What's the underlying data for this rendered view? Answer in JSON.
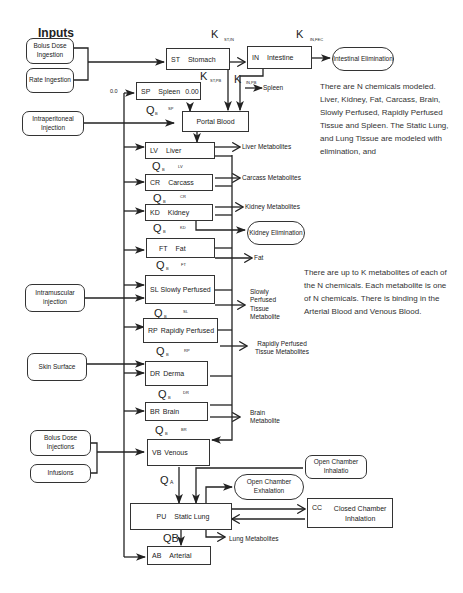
{
  "title": "Inputs",
  "inputs": {
    "bolus_ingestion": "Bolus Dose Ingestion",
    "rate_ingestion": "Rate Ingestion",
    "intraperitoneal": "Intraperitoneal Injection",
    "intramuscular": "Intramuscular injection",
    "skin_surface": "Skin Surface",
    "bolus_injections": "Bolus Dose Injections",
    "infusions": "Infusions"
  },
  "compartments": {
    "stomach": {
      "code": "ST",
      "name": "Stomach"
    },
    "intestine": {
      "code": "IN",
      "name": "Intestine"
    },
    "spleen": {
      "code": "SP",
      "name": "Spleen",
      "value": "0.00"
    },
    "portal_blood": {
      "name": "Portal Blood"
    },
    "liver": {
      "code": "LV",
      "name": "Liver"
    },
    "carcass": {
      "code": "CR",
      "name": "Carcass"
    },
    "kidney": {
      "code": "KD",
      "name": "Kidney"
    },
    "fat": {
      "code": "FT",
      "name": "Fat"
    },
    "slowly_perfused": {
      "code": "SL",
      "name": "Slowly Perfused"
    },
    "rapidly_perfused": {
      "code": "RP",
      "name": "Rapidly Perfused"
    },
    "derma": {
      "code": "DR",
      "name": "Derma"
    },
    "brain": {
      "code": "BR",
      "name": "Brain"
    },
    "venous": {
      "code": "VB",
      "name": "Venous"
    },
    "static_lung": {
      "code": "PU",
      "name": "Static Lung"
    },
    "arterial": {
      "code": "AB",
      "name": "Arterial"
    },
    "closed_chamber": {
      "code": "CC",
      "name": "Closed Chamber Inhalation"
    }
  },
  "eliminations": {
    "intestinal": "Intestinal Elimination",
    "kidney": "Kidney Elimination",
    "open_exhalation": "Open Chamber Exhalation",
    "open_inhalation": "Open Chamber Inhalatio"
  },
  "outputs": {
    "liver_met": "Liver Metabolites",
    "carcass_met": "Carcass Metabolites",
    "kidney_met": "Kidney Metabolites",
    "fat": "Fat",
    "spleen": "Spleen",
    "slowly_met": "Slowly Perfused Tissue Metabolite",
    "rapidly_met": "Rapidly Perfused Tissue Metabolites",
    "brain_met": "Brain Metabolite",
    "lung_met": "Lung Metabolites"
  },
  "rates": {
    "k_st_in": {
      "sym": "K",
      "sub": "ST,IN"
    },
    "k_in_fec": {
      "sym": "K",
      "sub": "IN,FEC"
    },
    "k_st_pb": {
      "sym": "K",
      "sub": "ST,PB"
    },
    "k_in_pb": {
      "sym": "K",
      "sub": "IN,PB"
    },
    "zero_in": "0.0",
    "qb": "Q",
    "qb_sub": "B",
    "q_sp": "SP",
    "q_lv": "LV",
    "q_cr": "CR",
    "q_kd": "KD",
    "q_ft": "FT",
    "q_sl": "SL",
    "q_rp": "RP",
    "q_dr": "DR",
    "q_br": "BR",
    "qa": "Q",
    "qa_sub": "A",
    "qb_lung": "QB"
  },
  "notes": {
    "chemicals": "There are N chemicals modeled. Liver, Kidney, Fat, Carcass, Brain, Slowly Perfused, Rapidly Perfused Tissue and Spleen. The Static Lung, and Lung Tissue are modeled with elimination, and",
    "metabolites": "There are up to K metabolites of each of the N chemicals. Each metabolite is one of N chemicals. There is binding in the Arterial Blood and Venous Blood."
  }
}
